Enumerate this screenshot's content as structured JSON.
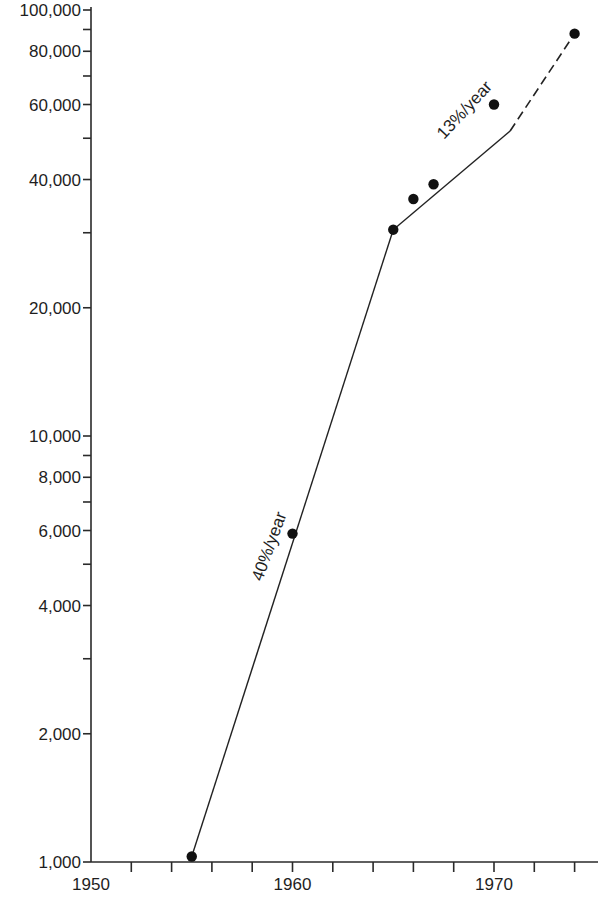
{
  "chart_data": {
    "type": "line",
    "title": "",
    "xlabel": "",
    "ylabel": "",
    "yscale": "log",
    "xlim": [
      1950,
      1976
    ],
    "ylim": [
      1000,
      100000
    ],
    "grid": false,
    "legend": null,
    "x_ticks": {
      "major": [
        1950,
        1960,
        1970
      ],
      "minor_every": 2,
      "labels": [
        "1950",
        "1960",
        "1970"
      ]
    },
    "y_ticks": {
      "labeled": [
        1000,
        2000,
        4000,
        6000,
        8000,
        10000,
        20000,
        40000,
        60000,
        80000,
        100000
      ],
      "labels": [
        "1,000",
        "2,000",
        "4,000",
        "6,000",
        "8,000",
        "10,000",
        "20,000",
        "40,000",
        "60,000",
        "80,000",
        "100,000"
      ],
      "unlabeled": [
        3000,
        5000,
        7000,
        9000,
        30000,
        50000,
        70000,
        90000
      ]
    },
    "series": [
      {
        "name": "observed",
        "kind": "points",
        "x": [
          1955,
          1960,
          1965,
          1966,
          1967,
          1970,
          1974
        ],
        "values": [
          1030,
          5900,
          30500,
          36000,
          39000,
          60000,
          88000
        ]
      }
    ],
    "trend_lines": [
      {
        "label": "40%/year",
        "from": [
          1955,
          1030
        ],
        "to": [
          1965,
          30500
        ],
        "style": "solid"
      },
      {
        "label": "13%/year",
        "from": [
          1965,
          30500
        ],
        "to": [
          1970.8,
          52000
        ],
        "style": "solid"
      },
      {
        "label": "13%/year (extrapolated)",
        "from": [
          1970.8,
          52000
        ],
        "to": [
          1974,
          88000
        ],
        "style": "dashed"
      }
    ],
    "annotations": [
      {
        "text": "40%/year",
        "near": [
          1959,
          4500
        ],
        "rotation": -70
      },
      {
        "text": "13%/year",
        "near": [
          1968.5,
          55000
        ],
        "rotation": -47
      }
    ]
  },
  "labels": {
    "annot_40": "40%/year",
    "annot_13": "13%/year"
  }
}
